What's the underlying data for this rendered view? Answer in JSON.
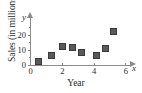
{
  "chart_data": {
    "type": "scatter",
    "title": "",
    "xlabel": "Year",
    "ylabel": "Sales (in millions)",
    "x_axis_variable": "x",
    "y_axis_variable": "y",
    "xlim": [
      0,
      6.6
    ],
    "ylim": [
      0,
      27
    ],
    "grid": false,
    "legend": null,
    "xticks": [
      0,
      2,
      4,
      6
    ],
    "xticklabels": [
      "0",
      "2",
      "4",
      "6"
    ],
    "yticks": [
      0,
      10,
      20
    ],
    "yticklabels": [
      "0",
      "10",
      "20"
    ],
    "minor_yticks": [
      5,
      15,
      25
    ],
    "marker": "square",
    "marker_color": "#595959",
    "axis_color": "#8a8a8a",
    "points": [
      {
        "x": 0.5,
        "y": 2.5
      },
      {
        "x": 1.3,
        "y": 7.0
      },
      {
        "x": 2.0,
        "y": 13.0
      },
      {
        "x": 2.6,
        "y": 12.0
      },
      {
        "x": 3.2,
        "y": 9.0
      },
      {
        "x": 4.1,
        "y": 7.0
      },
      {
        "x": 4.7,
        "y": 11.5
      },
      {
        "x": 5.2,
        "y": 22.5
      }
    ]
  }
}
